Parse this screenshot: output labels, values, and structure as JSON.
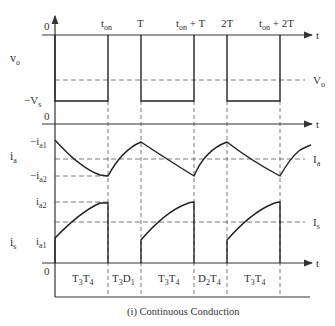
{
  "title": "(i) Continuous Conduction",
  "top_labels": {
    "zero": "0",
    "t_on": "t",
    "t_on_sub": "on",
    "T": "T",
    "t_on_T": "t",
    "t_on_T_sub": "on",
    "t_on_T_suffix": " + T",
    "two_T": "2T",
    "t_on_2T": "t",
    "t_on_2T_sub": "on",
    "t_on_2T_suffix": " + 2T"
  },
  "vo_panel": {
    "label": "v",
    "label_sub": "o",
    "neg_vs": "−V",
    "neg_vs_sub": "s",
    "avg": "V",
    "avg_sub": "o",
    "axis_t": "t"
  },
  "ia_panel": {
    "zero": "0",
    "label": "i",
    "label_sub": "a",
    "top": "−i",
    "top_sub": "a1",
    "bottom": "−i",
    "bottom_sub": "a2",
    "avg": "I",
    "avg_sub": "a",
    "axis_t": "t"
  },
  "is_panel": {
    "label": "i",
    "label_sub": "s",
    "top": "i",
    "top_sub": "a2",
    "bottom": "i",
    "bottom_sub": "a1",
    "avg": "I",
    "avg_sub": "s",
    "zero": "0",
    "axis_t": "t"
  },
  "intervals": [
    {
      "a": "T",
      "a_sub": "3",
      "b": "T",
      "b_sub": "4"
    },
    {
      "a": "T",
      "a_sub": "3",
      "b": "D",
      "b_sub": "1"
    },
    {
      "a": "T",
      "a_sub": "3",
      "b": "T",
      "b_sub": "4"
    },
    {
      "a": "D",
      "a_sub": "2",
      "b": "T",
      "b_sub": "4"
    },
    {
      "a": "T",
      "a_sub": "3",
      "b": "T",
      "b_sub": "4"
    }
  ]
}
